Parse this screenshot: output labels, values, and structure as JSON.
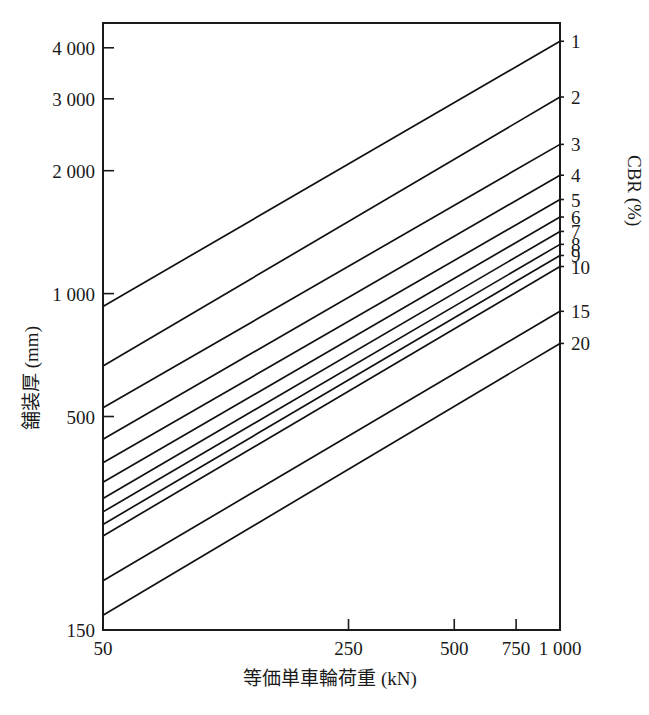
{
  "chart_data": {
    "type": "line",
    "title": "",
    "xlabel": "等価単車輪荷重 (kN)",
    "ylabel": "舗装厚 (mm)",
    "legend_title": "CBR (%)",
    "legend_position": "right-axis",
    "xscale": "log",
    "yscale": "log",
    "xlim": [
      50,
      1000
    ],
    "ylim": [
      150,
      4600
    ],
    "grid": false,
    "xticks": [
      50,
      250,
      500,
      750,
      1000
    ],
    "xtick_labels": [
      "50",
      "250",
      "500",
      "750",
      "1 000"
    ],
    "yticks": [
      150,
      500,
      1000,
      2000,
      3000,
      4000
    ],
    "ytick_labels": [
      "150",
      "500",
      "1 000",
      "2 000",
      "3 000",
      "4 000"
    ],
    "x": [
      50,
      1000
    ],
    "series": [
      {
        "name": "1",
        "label": "1",
        "values": [
          930,
          4150
        ]
      },
      {
        "name": "2",
        "label": "2",
        "values": [
          665,
          3030
        ]
      },
      {
        "name": "3",
        "label": "3",
        "values": [
          525,
          2320
        ]
      },
      {
        "name": "4",
        "label": "4",
        "values": [
          440,
          1950
        ]
      },
      {
        "name": "5",
        "label": "5",
        "values": [
          385,
          1700
        ]
      },
      {
        "name": "6",
        "label": "6",
        "values": [
          345,
          1540
        ]
      },
      {
        "name": "7",
        "label": "7",
        "values": [
          315,
          1420
        ]
      },
      {
        "name": "8",
        "label": "8",
        "values": [
          292,
          1320
        ]
      },
      {
        "name": "9",
        "label": "9",
        "values": [
          272,
          1240
        ]
      },
      {
        "name": "10",
        "label": "10",
        "values": [
          255,
          1165
        ]
      },
      {
        "name": "15",
        "label": "15",
        "values": [
          198,
          905
        ]
      },
      {
        "name": "20",
        "label": "20",
        "values": [
          163,
          755
        ]
      }
    ]
  },
  "axes": {
    "y_axis_name": "舗装厚 (mm)",
    "x_axis_name": "等価単車輪荷重 (kN)",
    "right_axis_name": "CBR (%)"
  }
}
